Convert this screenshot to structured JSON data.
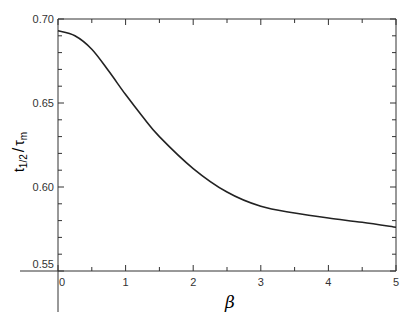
{
  "chart_data": {
    "type": "line",
    "title": "",
    "xlabel": "β",
    "ylabel": "t1/2 / τm",
    "ylabel_parts": {
      "t": "t",
      "sub": "1/2",
      "slash": "/",
      "tau": "τ",
      "tau_sub": "m"
    },
    "xlim": [
      0,
      5
    ],
    "ylim": [
      0.55,
      0.7
    ],
    "xticks": [
      "0",
      "1",
      "2",
      "3",
      "4",
      "5"
    ],
    "yticks": [
      "0.55",
      "0.60",
      "0.65",
      "0.70"
    ],
    "grid": false,
    "legend": null,
    "series": [
      {
        "name": "t1/2/τm",
        "x": [
          0,
          0.25,
          0.5,
          0.75,
          1.0,
          1.25,
          1.5,
          2.0,
          2.5,
          3.0,
          3.5,
          4.0,
          4.5,
          5.0
        ],
        "y": [
          0.693,
          0.69,
          0.682,
          0.669,
          0.655,
          0.642,
          0.63,
          0.611,
          0.597,
          0.5885,
          0.5845,
          0.5815,
          0.579,
          0.576
        ]
      }
    ]
  }
}
